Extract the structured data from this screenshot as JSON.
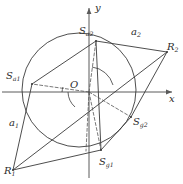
{
  "figure": {
    "type": "geometry-diagram",
    "background_color": "#ffffff",
    "stroke_color": "#3a3a3a",
    "axis_color": "#555555",
    "width": 183,
    "height": 184
  },
  "axes": {
    "x_label": "x",
    "y_label": "y",
    "origin_label": "O",
    "origin_px": {
      "x": 89,
      "y": 92
    }
  },
  "circle": {
    "center_px": {
      "x": 79,
      "y": 90
    },
    "radius_px": 57
  },
  "points": [
    {
      "id": "S_a1",
      "base": "S",
      "sub": "a1",
      "label_x": 6,
      "label_y": 71,
      "marker_px": {
        "x": 32,
        "y": 84
      }
    },
    {
      "id": "S_a2",
      "base": "S",
      "sub": "a2",
      "label_x": 79,
      "label_y": 26,
      "marker_px": {
        "x": 96,
        "y": 41
      }
    },
    {
      "id": "S_g1",
      "base": "S",
      "sub": "g1",
      "label_x": 99,
      "label_y": 157,
      "marker_px": {
        "x": 101,
        "y": 150
      }
    },
    {
      "id": "S_g2",
      "base": "S",
      "sub": "g2",
      "label_x": 133,
      "label_y": 117,
      "marker_px": {
        "x": 131,
        "y": 117
      }
    },
    {
      "id": "R_2",
      "base": "R",
      "sub": "2",
      "label_x": 167,
      "label_y": 42,
      "marker_px": {
        "x": 167,
        "y": 52
      }
    },
    {
      "id": "R_1",
      "base": "R",
      "sub": "1",
      "label_x": 4,
      "label_y": 166,
      "marker_px": {
        "x": 13,
        "y": 170
      }
    }
  ],
  "segment_labels": [
    {
      "id": "a_2",
      "base": "a",
      "sub": "2",
      "label_x": 131,
      "label_y": 27
    },
    {
      "id": "a_1",
      "base": "a",
      "sub": "1",
      "label_x": 9,
      "label_y": 118
    }
  ]
}
